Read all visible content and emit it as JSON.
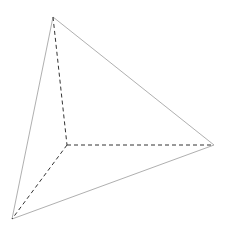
{
  "diagram": {
    "type": "tetrahedron-wireframe",
    "width": 229,
    "height": 232,
    "vertices": {
      "top": [
        53,
        17
      ],
      "center": [
        67,
        145
      ],
      "right": [
        214,
        145
      ],
      "bottom_left": [
        12,
        219
      ]
    },
    "edges": [
      {
        "from": "top",
        "to": "right",
        "style": "solid"
      },
      {
        "from": "top",
        "to": "bottom_left",
        "style": "solid"
      },
      {
        "from": "bottom_left",
        "to": "right",
        "style": "solid"
      },
      {
        "from": "top",
        "to": "center",
        "style": "dashed"
      },
      {
        "from": "center",
        "to": "right",
        "style": "dashed"
      },
      {
        "from": "center",
        "to": "bottom_left",
        "style": "dashed"
      }
    ],
    "colors": {
      "background": "#ffffff",
      "solid_edge": "#9a9a9a",
      "dashed_edge": "#333333"
    }
  }
}
